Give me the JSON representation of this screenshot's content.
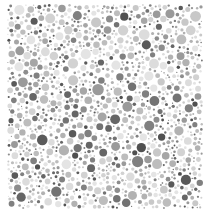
{
  "image": {
    "kind": "ishihara-style-dot-plate",
    "title": "Grayscale pseudoisochromatic dot plate",
    "width": 210,
    "height": 218,
    "background_color": "#ffffff",
    "hidden_figure": "none",
    "caption": ""
  },
  "plate": {
    "shape": "square",
    "left": 7,
    "top": 4,
    "width": 196,
    "height": 205,
    "dot_count": 1150,
    "dot_min_diameter": 2,
    "dot_max_diameter": 12,
    "dot_gap": 0.6,
    "palette": [
      "#e4e4e4",
      "#dcdcdc",
      "#d2d2d2",
      "#c8c8c8",
      "#bdbdbd",
      "#b2b2b2",
      "#a6a6a6",
      "#9a9a9a",
      "#8d8d8d",
      "#808080",
      "#737373",
      "#666666",
      "#5a5a5a",
      "#505050"
    ],
    "palette_weights": [
      10,
      10,
      10,
      9,
      9,
      8,
      8,
      7,
      6,
      6,
      5,
      5,
      4,
      3
    ],
    "seed": 20240517
  }
}
